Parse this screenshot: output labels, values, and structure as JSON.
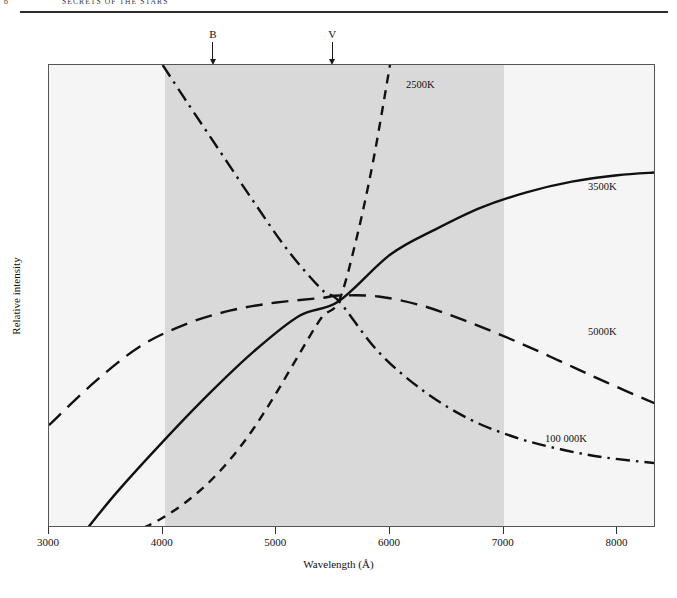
{
  "running_head": {
    "folio": "6",
    "chapter_title": "SECRETS OF THE STARS"
  },
  "figure": {
    "band_markers": [
      {
        "name": "marker-b",
        "letter": "B",
        "wavelength": 4450
      },
      {
        "name": "marker-v",
        "letter": "V",
        "wavelength": 5500
      }
    ]
  },
  "chart_data": {
    "type": "line",
    "title": "",
    "xlabel": "Wavelength (Å)",
    "ylabel": "Relative intensity",
    "xlim": [
      3000,
      8340
    ],
    "ylim": [
      0,
      1
    ],
    "xticks": [
      3000,
      4000,
      5000,
      6000,
      7000,
      8000
    ],
    "xtick_labels": [
      "3000",
      "4000",
      "5000",
      "6000",
      "7000",
      "8000"
    ],
    "yticks": [],
    "ytick_labels": [],
    "grid": false,
    "legend_position": "inline-curve-labels",
    "shaded_regions": [
      {
        "name": "visible-spectrum-band",
        "x_start": 4000,
        "x_end": 7000,
        "color": "#d9d9d9"
      }
    ],
    "annotations": [
      {
        "text": "B",
        "x": 4450,
        "note": "blue filter band centre, arrow from top"
      },
      {
        "text": "V",
        "x": 5500,
        "note": "visual filter band centre, arrow from top"
      }
    ],
    "crossover_point": {
      "x": 5550,
      "y": 0.49
    },
    "series": [
      {
        "name": "2500K",
        "label": "2500K",
        "style": "short-dashed",
        "color": "#111111",
        "x": [
          3830,
          4000,
          4200,
          4400,
          4600,
          4800,
          5000,
          5200,
          5400,
          5550,
          5700,
          5850,
          6000
        ],
        "values": [
          0.0,
          0.022,
          0.055,
          0.097,
          0.15,
          0.215,
          0.292,
          0.375,
          0.455,
          0.49,
          0.62,
          0.79,
          1.0
        ]
      },
      {
        "name": "3500K",
        "label": "3500K",
        "style": "solid",
        "color": "#111111",
        "x": [
          3340,
          3600,
          4000,
          4400,
          4800,
          5200,
          5550,
          6000,
          6400,
          6800,
          7200,
          7600,
          8000,
          8340
        ],
        "values": [
          0.0,
          0.078,
          0.186,
          0.288,
          0.381,
          0.458,
          0.49,
          0.59,
          0.645,
          0.692,
          0.725,
          0.748,
          0.762,
          0.768
        ]
      },
      {
        "name": "5000K",
        "label": "5000K",
        "style": "long-dashed",
        "color": "#111111",
        "x": [
          3000,
          3400,
          3800,
          4200,
          4600,
          5000,
          5400,
          5550,
          5900,
          6300,
          6700,
          7100,
          7500,
          7900,
          8340
        ],
        "values": [
          0.222,
          0.315,
          0.392,
          0.44,
          0.47,
          0.487,
          0.497,
          0.502,
          0.5,
          0.479,
          0.444,
          0.404,
          0.36,
          0.315,
          0.268
        ]
      },
      {
        "name": "100 000K",
        "label": "100 000K",
        "style": "dash-dot",
        "color": "#111111",
        "x": [
          4000,
          4200,
          4500,
          4800,
          5100,
          5400,
          5550,
          5900,
          6300,
          6700,
          7100,
          7500,
          7900,
          8340
        ],
        "values": [
          1.0,
          0.925,
          0.815,
          0.705,
          0.6,
          0.515,
          0.49,
          0.38,
          0.295,
          0.235,
          0.196,
          0.17,
          0.152,
          0.14
        ]
      }
    ]
  }
}
